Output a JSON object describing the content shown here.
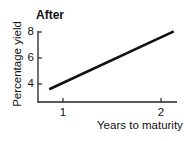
{
  "chart_data": {
    "type": "line",
    "title": "After",
    "xlabel": "Years to maturity",
    "ylabel": "Percentage yield",
    "x_ticks": [
      1,
      2
    ],
    "y_ticks": [
      4,
      6,
      8
    ],
    "xlim": [
      0.75,
      2.15
    ],
    "ylim": [
      2.6,
      8.1
    ],
    "grid": false,
    "legend": null,
    "series": [
      {
        "name": "yield curve",
        "x": [
          0.86,
          2.13
        ],
        "y": [
          3.6,
          8.05
        ],
        "color": "#111111"
      }
    ]
  },
  "labels": {
    "title": "After",
    "xlabel": "Years to maturity",
    "ylabel": "Percentage yield",
    "yticks": [
      "8",
      "6",
      "4"
    ],
    "xticks": [
      "1",
      "2"
    ]
  }
}
